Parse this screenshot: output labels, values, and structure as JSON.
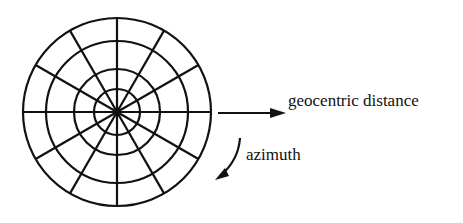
{
  "diagram": {
    "type": "polar-grid",
    "center": [
      117,
      112
    ],
    "rings": [
      23,
      43,
      71,
      94
    ],
    "spoke_count": 12,
    "stroke_color": "#111111"
  },
  "labels": {
    "radial_axis": "geocentric distance",
    "angular_axis": "azimuth"
  }
}
